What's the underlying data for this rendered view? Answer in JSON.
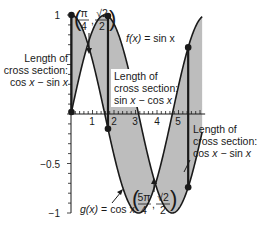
{
  "diagram": {
    "type": "area-between-curves",
    "curves": [
      {
        "name": "f",
        "label_fn": "f(x)",
        "label_eq": "= sin x",
        "expression": "sin x"
      },
      {
        "name": "g",
        "label_fn": "g(x)",
        "label_eq": "= cos x",
        "expression": "cos x"
      }
    ],
    "x_ticks": [
      "1",
      "2",
      "3",
      "4",
      "5"
    ],
    "y_ticks": [
      "1",
      "−0.5",
      "−1"
    ],
    "intersections": [
      {
        "num_x": "π",
        "den_x": "4",
        "num_y": "√2",
        "den_y": "2"
      },
      {
        "num_x": "5π",
        "den_x": "4",
        "num_y": "√2",
        "den_y": "2"
      }
    ],
    "cross_sections": [
      {
        "line1": "Length of",
        "line2": "cross section:",
        "line3a": "cos ",
        "line3x1": "x",
        "line3b": " − sin ",
        "line3x2": "x"
      },
      {
        "line1": "Length of",
        "line2": "cross section:",
        "line3a": "sin ",
        "line3x1": "x",
        "line3b": " − cos ",
        "line3x2": "x"
      },
      {
        "line1": "Length of",
        "line2": "cross section:",
        "line3a": "cos ",
        "line3x1": "x",
        "line3b": " − sin ",
        "line3x2": "x"
      }
    ],
    "colors": {
      "shade": "#bdbdbd",
      "curve": "#1a1a1a",
      "axis": "#1a1a1a"
    }
  }
}
